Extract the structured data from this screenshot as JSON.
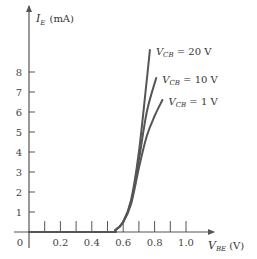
{
  "chart_data": {
    "type": "line",
    "title": "",
    "xlabel": "V_BE (V)",
    "xlabel_main": "V",
    "xlabel_sub": "BE",
    "xlabel_unit": "(V)",
    "ylabel": "I_E (mA)",
    "ylabel_main": "I",
    "ylabel_sub": "E",
    "ylabel_unit": "(mA)",
    "xlim": [
      0,
      1.1
    ],
    "ylim": [
      0,
      9
    ],
    "x_ticks": [
      0.1,
      0.2,
      0.3,
      0.4,
      0.5,
      0.6,
      0.7,
      0.8,
      0.9,
      1.0
    ],
    "x_tick_labels": [
      "0",
      "0.2",
      "0.4",
      "0.6",
      "0.8",
      "1.0"
    ],
    "x_tick_label_values": [
      0,
      0.2,
      0.4,
      0.6,
      0.8,
      1.0
    ],
    "y_ticks": [
      1,
      2,
      3,
      4,
      5,
      6,
      7,
      8
    ],
    "y_tick_labels": [
      "1",
      "2",
      "3",
      "4",
      "5",
      "6",
      "7",
      "8"
    ],
    "grid": false,
    "legend": "inline labels at curve ends",
    "series": [
      {
        "name": "V_CB = 20 V",
        "label_main": "V",
        "label_sub": "CB",
        "label_rest": " = 20 V",
        "x": [
          0,
          0.5,
          0.55,
          0.6,
          0.65,
          0.7,
          0.75,
          0.77
        ],
        "values": [
          0,
          0,
          0.1,
          0.5,
          1.6,
          4.0,
          7.6,
          9.1
        ]
      },
      {
        "name": "V_CB = 10 V",
        "label_main": "V",
        "label_sub": "CB",
        "label_rest": " = 10 V",
        "x": [
          0,
          0.5,
          0.55,
          0.6,
          0.65,
          0.7,
          0.75,
          0.81
        ],
        "values": [
          0,
          0,
          0.1,
          0.5,
          1.5,
          3.6,
          6.0,
          7.7
        ]
      },
      {
        "name": "V_CB = 1 V",
        "label_main": "V",
        "label_sub": "CB",
        "label_rest": " = 1 V",
        "x": [
          0,
          0.5,
          0.55,
          0.6,
          0.65,
          0.7,
          0.75,
          0.8,
          0.85
        ],
        "values": [
          0,
          0,
          0.1,
          0.5,
          1.4,
          3.2,
          4.8,
          5.8,
          6.6
        ]
      }
    ],
    "colors": {
      "axis": "#555555",
      "curve": "#555555",
      "text": "#333333"
    }
  }
}
